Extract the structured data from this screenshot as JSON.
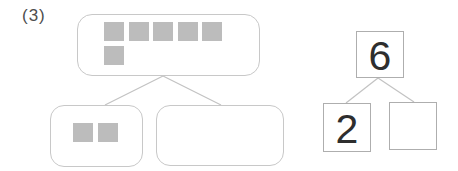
{
  "worksheet": {
    "problem_label": "(3)",
    "block_diagram": {
      "whole_total": 6,
      "whole_tiles_row1": 5,
      "whole_tiles_row2": 1,
      "part_left_tiles": 2,
      "part_right_tiles": 0
    },
    "number_bond": {
      "whole": "6",
      "part_left": "2",
      "part_right": ""
    }
  },
  "colors": {
    "tile_fill": "#bcbcbc",
    "rounded_box_border": "#c8c8c8",
    "square_border": "#aeaeae",
    "connector_line": "#c2c2c2",
    "digit_color": "#2e2e2e",
    "label_color": "#4d4d4d"
  }
}
